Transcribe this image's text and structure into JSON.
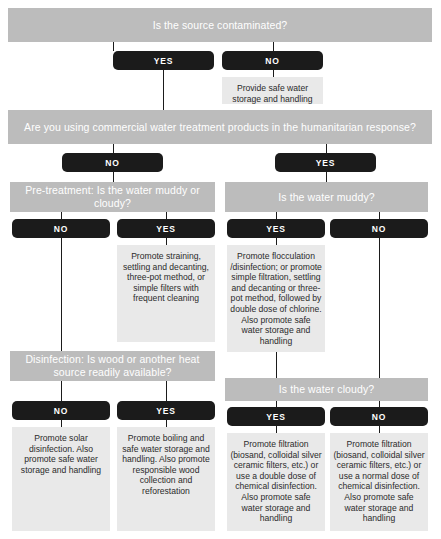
{
  "colors": {
    "question_bar": "#bcbcbc",
    "pill": "#1b1b1b",
    "outcome_box": "#e9e9e9",
    "background": "#ffffff",
    "line": "#1b1b1b"
  },
  "labels": {
    "yes": "YES",
    "no": "NO"
  },
  "questions": {
    "q1": "Is the source contaminated?",
    "q2": "Are you using commercial water treatment products in the humanitarian response?",
    "q3_left": "Pre-treatment:  Is the water muddy or cloudy?",
    "q3_right": "Is the water muddy?",
    "q4_left": "Disinfection: Is wood or another heat source readily available?",
    "q4_right": "Is the water cloudy?"
  },
  "outcomes": {
    "o_q1_no": "Provide safe water storage and handling",
    "o_q3left_yes": "Promote straining, settling and decanting, three-pot method, or simple filters with frequent cleaning",
    "o_q3right_yes": "Promote flocculation /disinfection; or promote simple filtration, settling and decanting or three-pot method, followed by double dose of chlorine. Also promote safe water storage and handling",
    "o_q4left_no": "Promote solar disinfection. Also promote safe water storage and handling",
    "o_q4left_yes": "Promote boiling and safe water storage and handling. Also promote responsible wood collection and reforestation",
    "o_q4right_yes": "Promote filtration (biosand, colloidal silver ceramic filters, etc.) or use a double dose of chemical disinfection. Also promote safe water storage and handling",
    "o_q4right_no": "Promote filtration (biosand, colloidal silver ceramic filters, etc.) or use a normal dose of chemical disinfection. Also promote safe water storage and handling"
  }
}
